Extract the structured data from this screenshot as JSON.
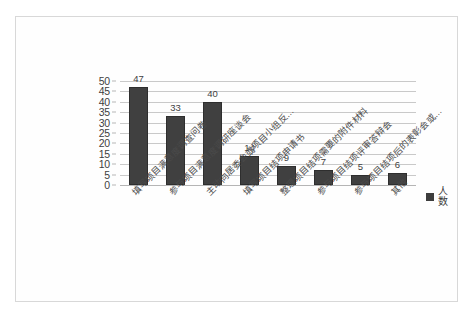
{
  "chart_data": {
    "type": "bar",
    "title": "",
    "subtitle": "",
    "xlabel": "",
    "ylabel": "",
    "ylim": [
      0,
      50
    ],
    "y_ticks": [
      0,
      5,
      10,
      15,
      20,
      25,
      30,
      35,
      40,
      45,
      50
    ],
    "grid": true,
    "legend_position": "right",
    "orientation": "vertical",
    "categories": [
      "填写项目满意度调查问卷",
      "参与项目满意度调研座谈会",
      "主动向居委会或项目小组反…",
      "填写项目结项申请书",
      "整理项目结项需要的附件材料",
      "参与项目结项评审答辩会",
      "参与项目结项后的表彰会或…",
      "其他"
    ],
    "series": [
      {
        "name": "人数",
        "color": "#404040",
        "values": [
          47,
          33,
          40,
          14,
          9,
          7,
          5,
          6
        ]
      }
    ],
    "data_labels": [
      "47",
      "33",
      "40",
      "14",
      "9",
      "7",
      "5",
      "6"
    ]
  },
  "legend": {
    "entries": [
      {
        "label": "人数",
        "color": "#404040"
      }
    ]
  },
  "axis": {
    "y_tick_labels": [
      "50",
      "45",
      "40",
      "35",
      "30",
      "25",
      "20",
      "15",
      "10",
      "5",
      "0"
    ]
  }
}
